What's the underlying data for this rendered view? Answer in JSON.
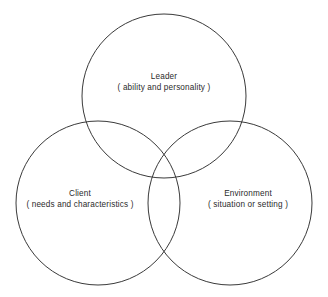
{
  "diagram": {
    "type": "venn-3-circle",
    "background_color": "#ffffff",
    "stroke_color": "#3a3a3a",
    "text_color": "#2b2b2b",
    "circles": [
      {
        "id": "leader",
        "title": "Leader",
        "subtitle": "( ability and personality )",
        "cx": 164,
        "cy": 96,
        "r": 82
      },
      {
        "id": "client",
        "title": "Client",
        "subtitle": "( needs and characteristics )",
        "cx": 98,
        "cy": 203,
        "r": 82
      },
      {
        "id": "environment",
        "title": "Environment",
        "subtitle": "( situation or setting )",
        "cx": 230,
        "cy": 203,
        "r": 82
      }
    ]
  }
}
